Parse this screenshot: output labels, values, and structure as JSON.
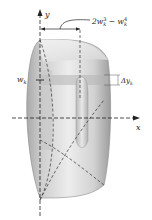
{
  "figure": {
    "axis_labels": {
      "y": "y",
      "x": "x"
    },
    "annotations": {
      "outer_width": {
        "base": "2w",
        "sub1": "k",
        "sup1": "3",
        "minus": " − w",
        "sub2": "k",
        "sup2": "4"
      },
      "level": {
        "base": "w",
        "sub": "k"
      },
      "thickness": {
        "base": "Δy",
        "sub": "k"
      }
    },
    "colors": {
      "solid_light": "#ececec",
      "solid_mid": "#c8c8c8",
      "solid_dark": "#9a9a9a",
      "line": "#333333"
    }
  }
}
